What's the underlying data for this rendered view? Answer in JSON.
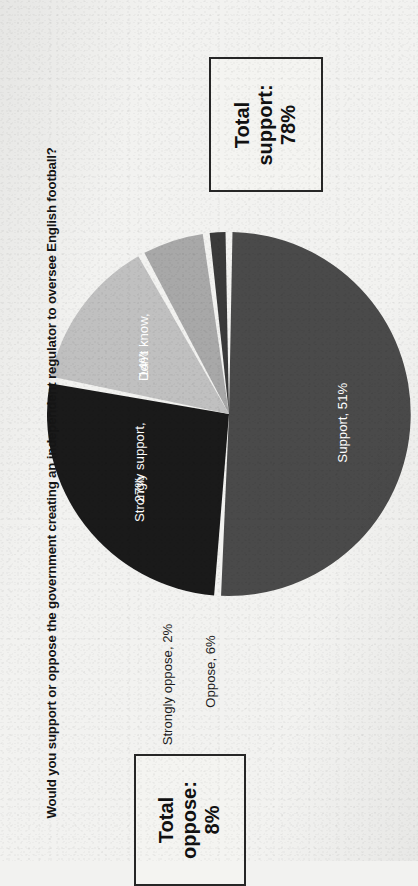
{
  "chart_data": {
    "type": "pie",
    "title": "Would you support or oppose the government creating an independent regulator to oversee English football?",
    "xlabel": "",
    "ylabel": "",
    "legend": "none",
    "grid": false,
    "unit": "%",
    "categories": [
      "Support",
      "Strongly support",
      "Don't know",
      "Oppose",
      "Strongly oppose"
    ],
    "values": [
      51,
      27,
      14,
      6,
      2
    ],
    "labels": [
      "Support, 51%",
      "Strongly support, 27%",
      "Don't know, 14%",
      "Oppose, 6%",
      "Strongly oppose, 2%"
    ],
    "colors": [
      "#4a4a4a",
      "#1a1a1a",
      "#c0c0c0",
      "#a8a8a8",
      "#3a3a3a"
    ],
    "label_placement": [
      "inside",
      "inside",
      "inside",
      "outside",
      "outside"
    ],
    "annotations": [
      {
        "text": "Total support: 78%",
        "value": 78,
        "line1": "Total",
        "line2": "support:",
        "line3": "78%"
      },
      {
        "text": "Total oppose: 8%",
        "value": 8,
        "line1": "Total",
        "line2": "oppose:",
        "line3": "8%"
      }
    ]
  },
  "header": {
    "title": "Would you support or oppose the government creating an independent regulator to oversee English football?"
  },
  "pie": {
    "slices": [
      {
        "name": "support",
        "label": "Support, 51%",
        "value": 51,
        "color": "#4a4a4a"
      },
      {
        "name": "strongly-support",
        "label": "Strongly support, 27%",
        "value": 27,
        "color": "#1a1a1a"
      },
      {
        "name": "dont-know",
        "label": "Don't know, 14%",
        "value": 14,
        "color": "#c0c0c0"
      },
      {
        "name": "oppose",
        "label": "Oppose, 6%",
        "value": 6,
        "color": "#a8a8a8"
      },
      {
        "name": "strongly-oppose",
        "label": "Strongly oppose, 2%",
        "value": 2,
        "color": "#3a3a3a"
      }
    ],
    "inner_labels": {
      "support_line1": "Support, 51%",
      "strongly_support_line1": "Strongly support,",
      "strongly_support_line2": "27%",
      "dont_know_line1": "Don't know,",
      "dont_know_line2": "14%"
    },
    "outer_labels": {
      "oppose": "Oppose, 6%",
      "strongly_oppose": "Strongly oppose, 2%"
    }
  },
  "callouts": {
    "total_support": {
      "line1": "Total",
      "line2": "support:",
      "line3": "78%"
    },
    "total_oppose": {
      "line1": "Total",
      "line2": "oppose:",
      "line3": "8%"
    }
  },
  "colors": {
    "background": "#f2f2f0",
    "support": "#4a4a4a",
    "strongly_support": "#1a1a1a",
    "dont_know": "#c0c0c0",
    "oppose": "#a8a8a8",
    "strongly_oppose": "#3a3a3a",
    "text": "#151515",
    "label_light": "#ffffff",
    "callout_border": "#262626"
  }
}
